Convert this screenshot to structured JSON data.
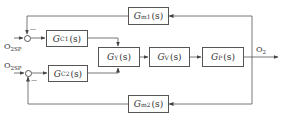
{
  "diagram": {
    "type": "block-diagram",
    "colors": {
      "line": "#555555",
      "text": "#333333",
      "background": "#ffffff"
    },
    "inputs": [
      {
        "id": "sp1",
        "label": "O",
        "sub": "2SP"
      },
      {
        "id": "sp2",
        "label": "O",
        "sub": "2SP"
      }
    ],
    "output": {
      "label": "O",
      "sub": "2"
    },
    "blocks": [
      {
        "id": "gm1",
        "main": "G",
        "sub": "m1",
        "arg": "(s)"
      },
      {
        "id": "gc1",
        "main": "G",
        "sub": "C1",
        "arg": "(s)"
      },
      {
        "id": "gc2",
        "main": "G",
        "sub": "C2",
        "arg": "(s)"
      },
      {
        "id": "gy",
        "main": "G",
        "sub": "Y",
        "arg": "(s)"
      },
      {
        "id": "gv",
        "main": "G",
        "sub": "V",
        "arg": "(s)"
      },
      {
        "id": "gp",
        "main": "G",
        "sub": "P",
        "arg": "(s)"
      },
      {
        "id": "gm2",
        "main": "G",
        "sub": "m2",
        "arg": "(s)"
      }
    ],
    "summing_junctions": [
      {
        "id": "s1",
        "signs": [
          "+",
          "-"
        ]
      },
      {
        "id": "s2",
        "signs": [
          "+",
          "-"
        ]
      }
    ],
    "sign_minus": "—",
    "connections": [
      [
        "sp1",
        "s1"
      ],
      [
        "s1",
        "gc1"
      ],
      [
        "gc1",
        "gy"
      ],
      [
        "sp2",
        "s2"
      ],
      [
        "s2",
        "gc2"
      ],
      [
        "gc2",
        "gy"
      ],
      [
        "gy",
        "gv"
      ],
      [
        "gv",
        "gp"
      ],
      [
        "gp",
        "output"
      ],
      [
        "output",
        "gm1"
      ],
      [
        "gm1",
        "s1"
      ],
      [
        "output",
        "gm2"
      ],
      [
        "gm2",
        "s2"
      ]
    ]
  }
}
